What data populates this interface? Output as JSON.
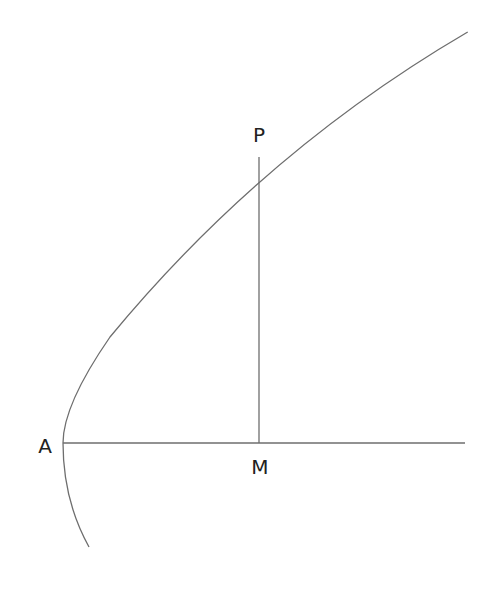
{
  "diagram": {
    "type": "parabola-geometry",
    "labels": {
      "vertex": "A",
      "point_on_curve": "P",
      "foot_on_axis": "M"
    },
    "colors": {
      "stroke": "#6e6e6e",
      "text": "#222222",
      "background": "#ffffff"
    },
    "elements": [
      {
        "id": "parabola",
        "kind": "curve",
        "description": "parabola opening rightward with vertex A"
      },
      {
        "id": "axis",
        "kind": "segment",
        "from": "A",
        "to": "right edge",
        "description": "horizontal axis through A and M"
      },
      {
        "id": "ordinate",
        "kind": "segment",
        "from": "P",
        "to": "M",
        "description": "vertical line from P perpendicular to axis at M"
      }
    ]
  }
}
